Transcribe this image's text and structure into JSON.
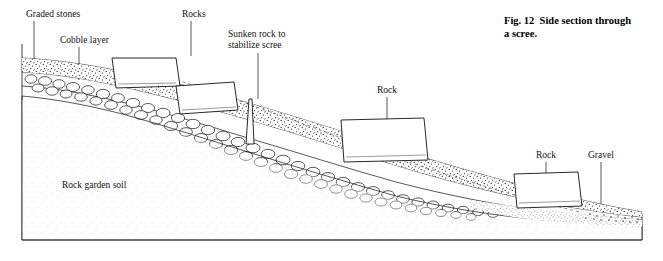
{
  "figure": {
    "caption_line1": "Fig. 12  Side section through",
    "caption_line2": "a scree.",
    "labels": [
      {
        "id": "graded-stones",
        "text": "Graded stones"
      },
      {
        "id": "cobble-layer",
        "text": "Cobble layer"
      },
      {
        "id": "rocks",
        "text": "Rocks"
      },
      {
        "id": "sunken-rock-line1",
        "text": "Sunken rock to"
      },
      {
        "id": "sunken-rock-line2",
        "text": "stabilize scree"
      },
      {
        "id": "rock-mid",
        "text": "Rock"
      },
      {
        "id": "rock-right",
        "text": "Rock"
      },
      {
        "id": "gravel",
        "text": "Gravel"
      },
      {
        "id": "rock-garden-soil",
        "text": "Rock garden soil"
      }
    ],
    "colors": {
      "ink": "#111111",
      "background": "#ffffff",
      "dashed_guide": "#555555"
    }
  }
}
